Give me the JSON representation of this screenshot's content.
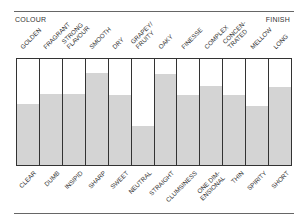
{
  "header": {
    "left": "COLOUR",
    "right": "FINISH"
  },
  "chart_data": {
    "type": "bar",
    "title": "",
    "top_labels": [
      "GOLDEN",
      "FRAGRANT",
      "STRONG FLAVOUR",
      "SMOOTH",
      "DRY",
      "GRAPEY/ FRUITY",
      "OAKY",
      "FINESSE",
      "COMPLEX",
      "CONCEN- TRATED",
      "MELLOW",
      "LONG"
    ],
    "categories": [
      "CLEAR",
      "DUMB",
      "INSIPID",
      "SHARP",
      "SWEET",
      "NEUTRAL",
      "STRAIGHT",
      "CLUMSINESS",
      "ONE DIM- ENSIONAL",
      "THIN",
      "SPIRITY",
      "SHORT"
    ],
    "values": [
      58,
      67,
      67,
      87,
      66,
      37,
      86,
      66,
      75,
      66,
      56,
      74
    ],
    "ylim": [
      0,
      100
    ],
    "xlabel": "",
    "ylabel": "",
    "grid": false,
    "fill_color": "#d4d4d4"
  }
}
